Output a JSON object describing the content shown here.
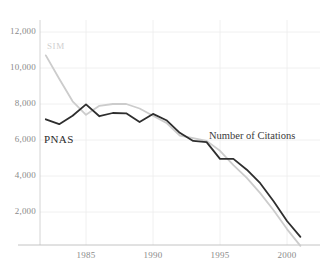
{
  "chart_data": {
    "type": "line",
    "title": "",
    "subtitle": "",
    "xlabel": "",
    "ylabel": "",
    "annotation": "Number of Citations",
    "xlim": [
      1982,
      2001
    ],
    "ylim": [
      0,
      13000
    ],
    "yticks": [
      2000,
      4000,
      6000,
      8000,
      10000,
      12000
    ],
    "ytick_labels": [
      "2,000",
      "4,000",
      "6,000",
      "8,000",
      "10,000",
      "12,000"
    ],
    "xticks": [
      1985,
      1990,
      1995,
      2000
    ],
    "xtick_labels": [
      "1985",
      "1990",
      "1995",
      "2000"
    ],
    "grid": true,
    "legend_position": "inline-labels",
    "x": [
      1982,
      1983,
      1984,
      1985,
      1986,
      1987,
      1988,
      1989,
      1990,
      1991,
      1992,
      1993,
      1994,
      1995,
      1996,
      1997,
      1998,
      1999,
      2000,
      2001
    ],
    "series": [
      {
        "name": "PNAS",
        "color": "#2e2e2e",
        "values": [
          7150,
          6880,
          7350,
          7980,
          7320,
          7500,
          7480,
          7000,
          7450,
          7100,
          6400,
          5950,
          5880,
          4950,
          4950,
          4350,
          3600,
          2600,
          1500,
          620
        ]
      },
      {
        "name": "SIM",
        "color": "#cccccc",
        "values": [
          10700,
          9400,
          8150,
          7400,
          7900,
          8000,
          8000,
          7750,
          7350,
          6950,
          6250,
          6100,
          5950,
          5400,
          4600,
          3900,
          3050,
          2100,
          1050,
          120
        ]
      }
    ]
  },
  "labels": {
    "pnas": "PNAS",
    "sim": "SIM",
    "annotation": "Number of Citations"
  }
}
